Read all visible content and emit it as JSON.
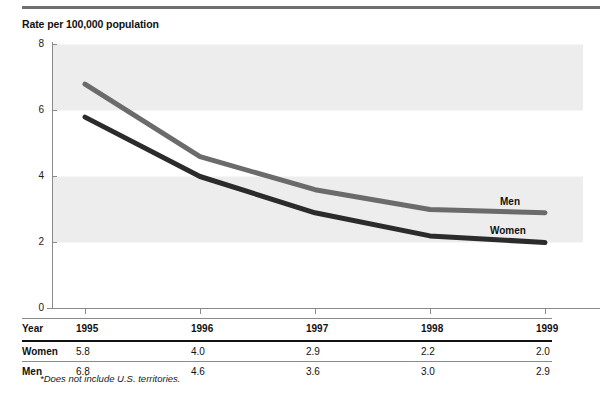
{
  "chart_title": "Rate per 100,000 population",
  "footnote": "*Does not include U.S. territories.",
  "colors": {
    "men_line": "#6b6b6b",
    "women_line": "#2b2b2b",
    "band": "#ededed",
    "axis": "#8a8a8a",
    "rule": "#6f6f6f"
  },
  "axis": {
    "y_ticks": [
      "0",
      "2",
      "4",
      "6",
      "8"
    ],
    "x_ticks": [
      "1995",
      "1996",
      "1997",
      "1998",
      "1999"
    ]
  },
  "series_labels": {
    "men": "Men",
    "women": "Women"
  },
  "table": {
    "row_headers": [
      "Year",
      "Women",
      "Men"
    ],
    "years": [
      "1995",
      "1996",
      "1997",
      "1998",
      "1999"
    ],
    "women": [
      "5.8",
      "4.0",
      "2.9",
      "2.2",
      "2.0"
    ],
    "men": [
      "6.8",
      "4.6",
      "3.6",
      "3.0",
      "2.9"
    ]
  },
  "chart_data": {
    "type": "line",
    "title": "Rate per 100,000 population",
    "xlabel": "Year",
    "ylabel": "Rate per 100,000 population",
    "x": [
      1995,
      1996,
      1997,
      1998,
      1999
    ],
    "categories": [
      "1995",
      "1996",
      "1997",
      "1998",
      "1999"
    ],
    "series": [
      {
        "name": "Men",
        "values": [
          6.8,
          4.6,
          3.6,
          3.0,
          2.9
        ],
        "color": "#6b6b6b"
      },
      {
        "name": "Women",
        "values": [
          5.8,
          4.0,
          2.9,
          2.2,
          2.0
        ],
        "color": "#2b2b2b"
      }
    ],
    "ylim": [
      0,
      8
    ],
    "yticks": [
      0,
      2,
      4,
      6,
      8
    ],
    "grid": false,
    "shaded_bands": [
      [
        2,
        4
      ],
      [
        6,
        8
      ]
    ],
    "legend": "inline-end-labels",
    "annotations": [
      "*Does not include U.S. territories."
    ]
  }
}
